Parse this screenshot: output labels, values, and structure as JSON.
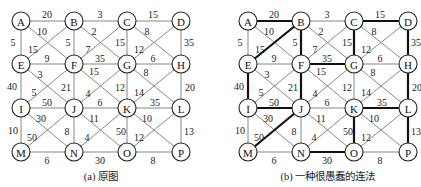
{
  "figures": [
    {
      "id": "a",
      "caption": "(a) 原图",
      "offset_x": 0,
      "bold_edges": []
    },
    {
      "id": "b",
      "caption": "(b) 一种很愚蠢的连法",
      "offset_x": 227,
      "bold_edges": [
        "A-B",
        "B-E",
        "B-F",
        "C-D",
        "C-G",
        "D-H",
        "F-G",
        "E-I",
        "F-J",
        "I-J",
        "J-M",
        "K-L",
        "H-L",
        "K-O",
        "N-O",
        "L-P"
      ]
    }
  ],
  "nodes": [
    {
      "id": "A",
      "x": 21,
      "y": 21
    },
    {
      "id": "B",
      "x": 74,
      "y": 21
    },
    {
      "id": "C",
      "x": 127,
      "y": 21
    },
    {
      "id": "D",
      "x": 181,
      "y": 21
    },
    {
      "id": "E",
      "x": 21,
      "y": 64
    },
    {
      "id": "F",
      "x": 74,
      "y": 64
    },
    {
      "id": "G",
      "x": 127,
      "y": 64
    },
    {
      "id": "H",
      "x": 181,
      "y": 64
    },
    {
      "id": "I",
      "x": 21,
      "y": 108
    },
    {
      "id": "J",
      "x": 74,
      "y": 108
    },
    {
      "id": "K",
      "x": 127,
      "y": 108
    },
    {
      "id": "L",
      "x": 181,
      "y": 108
    },
    {
      "id": "M",
      "x": 21,
      "y": 152
    },
    {
      "id": "N",
      "x": 74,
      "y": 152
    },
    {
      "id": "O",
      "x": 127,
      "y": 152
    },
    {
      "id": "P",
      "x": 181,
      "y": 152
    }
  ],
  "edges": [
    {
      "u": "A",
      "v": "B",
      "w": "20",
      "lx": 47,
      "ly": 14
    },
    {
      "u": "B",
      "v": "C",
      "w": "3",
      "lx": 100,
      "ly": 14
    },
    {
      "u": "C",
      "v": "D",
      "w": "15",
      "lx": 153,
      "ly": 14
    },
    {
      "u": "A",
      "v": "E",
      "w": "5",
      "lx": 13,
      "ly": 42
    },
    {
      "u": "B",
      "v": "F",
      "w": "5",
      "lx": 68,
      "ly": 42
    },
    {
      "u": "C",
      "v": "G",
      "w": "15",
      "lx": 120,
      "ly": 42
    },
    {
      "u": "D",
      "v": "H",
      "w": "35",
      "lx": 189,
      "ly": 42
    },
    {
      "u": "A",
      "v": "F",
      "w": "10",
      "lx": 42,
      "ly": 31
    },
    {
      "u": "B",
      "v": "E",
      "w": "15",
      "lx": 33,
      "ly": 49
    },
    {
      "u": "B",
      "v": "G",
      "w": "2",
      "lx": 94,
      "ly": 31
    },
    {
      "u": "C",
      "v": "F",
      "w": "7",
      "lx": 88,
      "ly": 49
    },
    {
      "u": "C",
      "v": "H",
      "w": "8",
      "lx": 147,
      "ly": 31
    },
    {
      "u": "D",
      "v": "G",
      "w": "12",
      "lx": 139,
      "ly": 49
    },
    {
      "u": "E",
      "v": "F",
      "w": "9",
      "lx": 47,
      "ly": 58
    },
    {
      "u": "F",
      "v": "G",
      "w": "35",
      "lx": 100,
      "ly": 58
    },
    {
      "u": "G",
      "v": "H",
      "w": "6",
      "lx": 153,
      "ly": 58
    },
    {
      "u": "E",
      "v": "I",
      "w": "40",
      "lx": 12,
      "ly": 86
    },
    {
      "u": "F",
      "v": "J",
      "w": "21",
      "lx": 66,
      "ly": 87
    },
    {
      "u": "G",
      "v": "K",
      "w": "12",
      "lx": 120,
      "ly": 87
    },
    {
      "u": "H",
      "v": "L",
      "w": "20",
      "lx": 190,
      "ly": 87
    },
    {
      "u": "E",
      "v": "J",
      "w": "3",
      "lx": 40,
      "ly": 74
    },
    {
      "u": "F",
      "v": "I",
      "w": "5",
      "lx": 34,
      "ly": 92
    },
    {
      "u": "F",
      "v": "K",
      "w": "15",
      "lx": 94,
      "ly": 71
    },
    {
      "u": "G",
      "v": "J",
      "w": "4",
      "lx": 88,
      "ly": 93
    },
    {
      "u": "G",
      "v": "L",
      "w": "8",
      "lx": 146,
      "ly": 72
    },
    {
      "u": "H",
      "v": "K",
      "w": "14",
      "lx": 139,
      "ly": 92
    },
    {
      "u": "I",
      "v": "J",
      "w": "50",
      "lx": 47,
      "ly": 102
    },
    {
      "u": "J",
      "v": "K",
      "w": "6",
      "lx": 100,
      "ly": 102
    },
    {
      "u": "K",
      "v": "L",
      "w": "35",
      "lx": 155,
      "ly": 102
    },
    {
      "u": "I",
      "v": "M",
      "w": "10",
      "lx": 13,
      "ly": 130
    },
    {
      "u": "J",
      "v": "N",
      "w": "8",
      "lx": 67,
      "ly": 131
    },
    {
      "u": "K",
      "v": "O",
      "w": "50",
      "lx": 121,
      "ly": 131
    },
    {
      "u": "L",
      "v": "P",
      "w": "13",
      "lx": 189,
      "ly": 131
    },
    {
      "u": "I",
      "v": "N",
      "w": "30",
      "lx": 41,
      "ly": 118
    },
    {
      "u": "J",
      "v": "M",
      "w": "50",
      "lx": 32,
      "ly": 137
    },
    {
      "u": "J",
      "v": "O",
      "w": "11",
      "lx": 94,
      "ly": 118
    },
    {
      "u": "K",
      "v": "N",
      "w": "4",
      "lx": 87,
      "ly": 137
    },
    {
      "u": "K",
      "v": "P",
      "w": "10",
      "lx": 147,
      "ly": 118
    },
    {
      "u": "L",
      "v": "O",
      "w": "12",
      "lx": 139,
      "ly": 137
    },
    {
      "u": "M",
      "v": "N",
      "w": "6",
      "lx": 47,
      "ly": 160
    },
    {
      "u": "N",
      "v": "O",
      "w": "30",
      "lx": 100,
      "ly": 160
    },
    {
      "u": "O",
      "v": "P",
      "w": "8",
      "lx": 153,
      "ly": 160
    }
  ],
  "node_radius": 9
}
